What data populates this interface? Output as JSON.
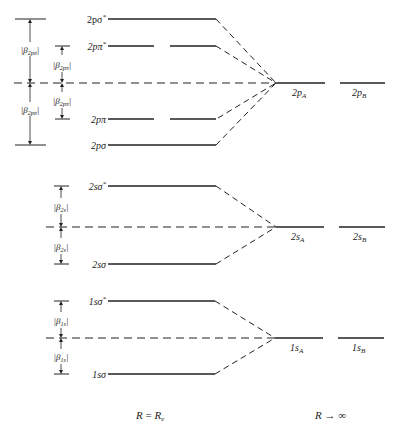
{
  "diagram": {
    "type": "molecular-orbital-energy-level-diagram",
    "groups": [
      {
        "id": "2p",
        "bonding_levels": [
          "2pσ",
          "2pπ"
        ],
        "antibonding_levels": [
          "2pσ*",
          "2pπ*"
        ],
        "atomic_levels": [
          "2pA",
          "2pB"
        ],
        "splitting_labels": [
          "|β2pσ|",
          "|β2pσ|",
          "|β2pπ|",
          "|β2pπ|"
        ]
      },
      {
        "id": "2s",
        "bonding_levels": [
          "2sσ"
        ],
        "antibonding_levels": [
          "2sσ*"
        ],
        "atomic_levels": [
          "2sA",
          "2sB"
        ],
        "splitting_labels": [
          "|β2s|",
          "|β2s|"
        ]
      },
      {
        "id": "1s",
        "bonding_levels": [
          "1sσ"
        ],
        "antibonding_levels": [
          "1sσ*"
        ],
        "atomic_levels": [
          "1sA",
          "1sB"
        ],
        "splitting_labels": [
          "|β1s|",
          "|β1s|"
        ]
      }
    ],
    "footer": {
      "left": "R = Re",
      "right": "R → ∞"
    }
  },
  "labels": {
    "p_sigma_star": {
      "main": "2pσ",
      "sup": "*"
    },
    "p_pi_star": {
      "main": "2pπ",
      "sup": "*"
    },
    "p_pi": "2pπ",
    "p_sigma": "2pσ",
    "pA": {
      "main": "2p",
      "sub": "A"
    },
    "pB": {
      "main": "2p",
      "sub": "B"
    },
    "beta_2psigma": {
      "main": "β",
      "sub": "2pσ"
    },
    "beta_2ppi": {
      "main": "β",
      "sub": "2pπ"
    },
    "s2_sigma_star": {
      "main": "2sσ",
      "sup": "*"
    },
    "s2_sigma": "2sσ",
    "sA2": {
      "main": "2s",
      "sub": "A"
    },
    "sB2": {
      "main": "2s",
      "sub": "B"
    },
    "beta_2s": {
      "main": "β",
      "sub": "2s"
    },
    "s1_sigma_star": {
      "main": "1sσ",
      "sup": "*"
    },
    "s1_sigma": "1sσ",
    "sA1": {
      "main": "1s",
      "sub": "A"
    },
    "sB1": {
      "main": "1s",
      "sub": "B"
    },
    "beta_1s": {
      "main": "β",
      "sub": "1s"
    },
    "footer_left": {
      "R": "R",
      "eq": " = ",
      "Re": "R",
      "e": "e"
    },
    "footer_right": {
      "R": "R",
      "arrow": " → ∞"
    }
  },
  "colors": {
    "ink": "#222222",
    "background": "#ffffff"
  }
}
